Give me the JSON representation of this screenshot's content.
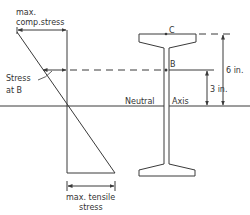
{
  "colors": {
    "line": "#3a3a3a",
    "text": "#333333",
    "background": "#ffffff"
  },
  "stress_diagram": {
    "max_comp_label_line1": "max.",
    "max_comp_label_line2": "comp.stress",
    "stress_at_b_line1": "Stress",
    "stress_at_b_line2": "at B",
    "max_tensile_line1": "max. tensile",
    "max_tensile_line2": "stress"
  },
  "beam": {
    "point_c_label": "C",
    "point_b_label": "B",
    "neutral_label": "Neutral",
    "axis_label": "Axis"
  },
  "dimensions": {
    "total_height_label": "6 in.",
    "b_height_label": "3 in."
  }
}
